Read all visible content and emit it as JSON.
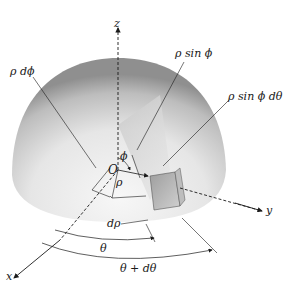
{
  "diagram": {
    "type": "spherical-coordinates-volume-element",
    "axes": {
      "z": "z",
      "y": "y",
      "x": "x",
      "origin": "O"
    },
    "labels": {
      "rho_dphi": "ρ dϕ",
      "rho_sin_phi": "ρ sin ϕ",
      "rho_sin_phi_dtheta": "ρ sin ϕ dθ",
      "phi": "ϕ",
      "rho": "ρ",
      "drho": "dρ",
      "theta": "θ",
      "theta_plus_dtheta": "θ + dθ"
    },
    "colors": {
      "line": "#1a1a1a",
      "hemisphere_light": "#f2f2f2",
      "hemisphere_dark": "#9a9a9a",
      "element_face": "#b5b5b5"
    }
  }
}
